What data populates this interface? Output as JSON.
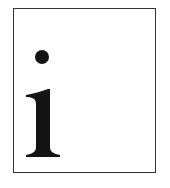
{
  "icon": {
    "name": "info-icon",
    "letter": "i",
    "colors": {
      "border": "#333333",
      "glyph": "#141414",
      "background": "#ffffff"
    }
  }
}
